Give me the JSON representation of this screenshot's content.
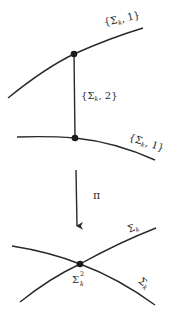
{
  "diagram": {
    "colors": {
      "stroke": "#2a2a2a",
      "background": "#ffffff"
    },
    "upper": {
      "top_curve_label": {
        "open": "{",
        "symbol": "Σ",
        "sub": "k",
        "rest": ", 1}"
      },
      "vertical_segment_label": {
        "open": "{",
        "symbol": "Σ",
        "sub": "k",
        "rest": ", 2}"
      },
      "bottom_curve_label": {
        "open": "{",
        "symbol": "Σ",
        "sub": "k",
        "rest": ", 1}"
      }
    },
    "map": {
      "label": "π"
    },
    "lower": {
      "upper_branch_label": {
        "symbol": "Σ",
        "sub": "k"
      },
      "lower_branch_label": {
        "symbol": "Σ",
        "sub": "k"
      },
      "node_label": {
        "symbol": "Σ",
        "sup": "2",
        "sub": "k"
      }
    }
  }
}
